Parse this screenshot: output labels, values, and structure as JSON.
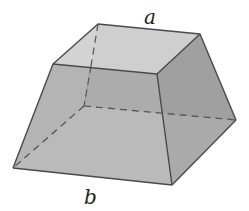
{
  "figure": {
    "type": "frustum of a square pyramid",
    "labels": {
      "top_edge": "a",
      "bottom_edge": "b"
    },
    "colors": {
      "top_face": "#d2d2d2",
      "front_face": "#a9a9a9",
      "right_face": "#9b9b9b",
      "edge": "#4a4a4a",
      "hidden_edge": "#555555",
      "background": "#ffffff"
    }
  }
}
